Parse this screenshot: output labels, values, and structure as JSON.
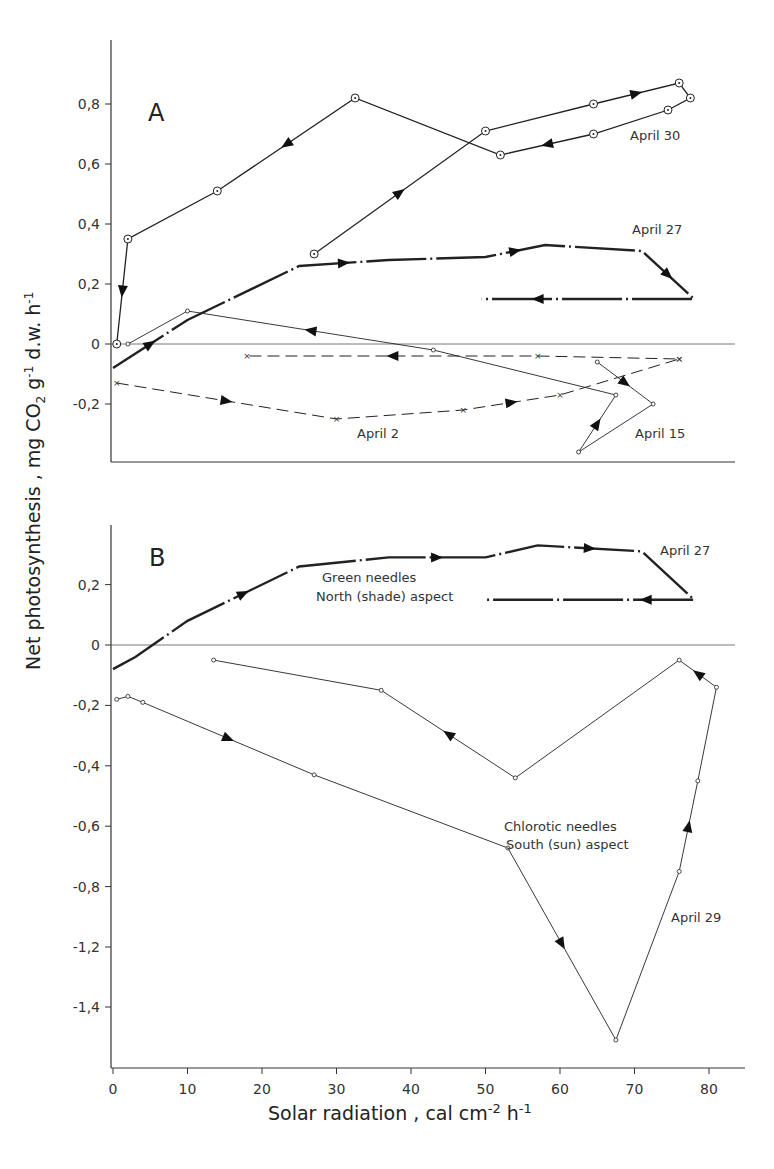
{
  "chart_data": [
    {
      "panel": "A",
      "type": "line",
      "title": "A",
      "xlabel": "Solar radiation, cal cm-2 h-1",
      "ylabel": "Net photosynthesis, mg CO2 g-1 d.w. h-1",
      "xlim": [
        0,
        85
      ],
      "ylim": [
        -0.39,
        0.98
      ],
      "yticks": [
        -0.2,
        0,
        0.2,
        0.4,
        0.6,
        0.8
      ],
      "ytick_labels": [
        "-0,2",
        "0",
        "0,2",
        "0,4",
        "0,6",
        "0,8"
      ],
      "grid": false,
      "series": [
        {
          "name": "April 30",
          "style": "solid-circle-dot",
          "x": [
            27,
            50,
            64.5,
            76,
            77.5,
            74.5,
            64.5,
            52,
            32.5,
            14,
            2,
            0.5
          ],
          "y": [
            0.3,
            0.71,
            0.8,
            0.87,
            0.82,
            0.78,
            0.7,
            0.63,
            0.82,
            0.51,
            0.35,
            0.0
          ]
        },
        {
          "name": "April 27",
          "style": "bold-dash-dot",
          "x": [
            0,
            10,
            25,
            37,
            50,
            58,
            71,
            78,
            64.5,
            49.5
          ],
          "y": [
            -0.08,
            0.08,
            0.26,
            0.28,
            0.29,
            0.33,
            0.31,
            0.15,
            0.15,
            0.15
          ]
        },
        {
          "name": "April 15",
          "style": "thin-small-circle",
          "x": [
            65,
            72.5,
            62.5,
            67.5,
            43,
            10,
            2
          ],
          "y": [
            -0.06,
            -0.2,
            -0.36,
            -0.17,
            -0.02,
            0.11,
            0.0
          ]
        },
        {
          "name": "April 2",
          "style": "dashed-x",
          "x": [
            0.5,
            30,
            47,
            60,
            76,
            76,
            57,
            18
          ],
          "y": [
            -0.13,
            -0.25,
            -0.22,
            -0.17,
            -0.05,
            -0.05,
            -0.04,
            -0.04
          ]
        }
      ],
      "annotations": [
        "A",
        "April 30",
        "April 27",
        "April 15",
        "April 2"
      ]
    },
    {
      "panel": "B",
      "type": "line",
      "title": "B",
      "xlabel": "Solar radiation, cal cm-2 h-1",
      "ylabel": "Net photosynthesis, mg CO2 g-1 d.w. h-1",
      "xlim": [
        0,
        85
      ],
      "xticks": [
        0,
        10,
        20,
        30,
        40,
        50,
        60,
        70,
        80
      ],
      "yticks": [
        -1.4,
        -1.2,
        -0.8,
        -0.6,
        -0.4,
        -0.2,
        0,
        0.2
      ],
      "ytick_labels": [
        "-1,4",
        "-1,2",
        "-0,8",
        "-0,6",
        "-0,4",
        "-0,2",
        "0",
        "0,2"
      ],
      "axis_break_note": "y-axis jumps from -0,8 to -1,2 with even spacing",
      "grid": false,
      "series": [
        {
          "name": "April 27 - Green needles, North (shade) aspect",
          "style": "bold-dash-dot",
          "x": [
            0,
            3,
            10,
            25,
            37,
            50,
            57,
            71,
            78,
            65,
            50
          ],
          "y": [
            -0.08,
            -0.04,
            0.08,
            0.26,
            0.29,
            0.29,
            0.33,
            0.31,
            0.15,
            0.15,
            0.15
          ]
        },
        {
          "name": "April 29 - Chlorotic needles, South (sun) aspect",
          "style": "thin-small-circle",
          "x": [
            0.5,
            2,
            4,
            27,
            53,
            67.5,
            76,
            78.5,
            81,
            76,
            54,
            36,
            13.5
          ],
          "y": [
            -0.18,
            -0.17,
            -0.19,
            -0.43,
            -0.87,
            -1.51,
            -0.75,
            -0.45,
            -0.14,
            -0.05,
            -0.44,
            -0.15,
            -0.05
          ]
        }
      ],
      "annotations": [
        "B",
        "April 27",
        "Green needles",
        "North (shade) aspect",
        "Chlorotic needles",
        "South (sun) aspect",
        "April 29"
      ]
    }
  ],
  "labels": {
    "panel_a": "A",
    "panel_b": "B",
    "april30": "April 30",
    "april27a": "April 27",
    "april15": "April 15",
    "april2": "April 2",
    "april27b": "April 27",
    "green1": "Green needles",
    "green2": "North (shade) aspect",
    "chlor1": "Chlorotic needles",
    "chlor2": "South (sun) aspect",
    "april29": "April 29",
    "xaxis": "Solar radiation , cal cm",
    "xaxis_sup": "-2",
    "xaxis_h": " h",
    "xaxis_sup2": "-1",
    "yaxis": "Net photosynthesis ,  mg CO2 g-1 d.w. h-1"
  }
}
